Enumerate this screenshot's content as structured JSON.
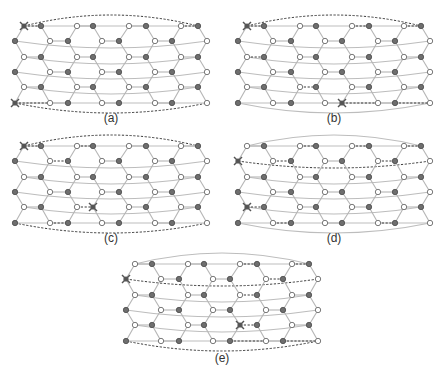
{
  "figure": {
    "legend": {
      "filled_node": "sublattice B",
      "hollow_node": "sublattice A",
      "x_marker": "defect / excitation",
      "dashed_line": "string operator path"
    },
    "lattice": {
      "rows": 6,
      "columns_per_row": 8,
      "row_types": [
        "even",
        "odd",
        "even",
        "odd",
        "even",
        "odd"
      ],
      "even_row_fill": [
        "H",
        "F",
        "H",
        "F",
        "H",
        "F",
        "H",
        "F"
      ],
      "odd_row_fill": [
        "F",
        "H",
        "F",
        "H",
        "F",
        "H",
        "F",
        "H"
      ]
    },
    "panels": [
      {
        "label": "(a)",
        "markers": [
          [
            0,
            0
          ],
          [
            5,
            0
          ]
        ],
        "dashed": {
          "top_arc": true,
          "bottom_arc": true,
          "wrap_rows": [],
          "segments": [
            [
              [
                0,
                0
              ],
              [
                0,
                1
              ]
            ],
            [
              [
                5,
                0
              ],
              [
                5,
                1
              ]
            ],
            [
              [
                0,
                6
              ],
              [
                0,
                7
              ]
            ]
          ]
        },
        "solid_arcs": {
          "top": false,
          "bottom": false
        }
      },
      {
        "label": "(b)",
        "markers": [
          [
            0,
            0
          ],
          [
            5,
            4
          ]
        ],
        "dashed": {
          "top_arc": true,
          "bottom_arc": false,
          "wrap_rows": [],
          "segments": [
            [
              [
                0,
                0
              ],
              [
                0,
                1
              ]
            ],
            [
              [
                0,
                4
              ],
              [
                0,
                5
              ]
            ],
            [
              [
                0,
                6
              ],
              [
                0,
                7
              ]
            ],
            [
              [
                2,
                0
              ],
              [
                2,
                1
              ]
            ],
            [
              [
                4,
                2
              ],
              [
                4,
                3
              ]
            ],
            [
              [
                5,
                4
              ],
              [
                5,
                5
              ]
            ],
            [
              [
                5,
                6
              ],
              [
                5,
                7
              ]
            ]
          ]
        },
        "solid_arcs": {
          "top": false,
          "bottom": true
        }
      },
      {
        "label": "(c)",
        "markers": [
          [
            0,
            0
          ],
          [
            4,
            3
          ]
        ],
        "dashed": {
          "top_arc": true,
          "bottom_arc": true,
          "wrap_rows": [],
          "segments": [
            [
              [
                0,
                0
              ],
              [
                0,
                1
              ]
            ],
            [
              [
                0,
                2
              ],
              [
                0,
                3
              ]
            ],
            [
              [
                1,
                1
              ],
              [
                1,
                2
              ]
            ],
            [
              [
                5,
                1
              ],
              [
                5,
                2
              ]
            ],
            [
              [
                4,
                2
              ],
              [
                4,
                3
              ]
            ]
          ]
        },
        "solid_arcs": {
          "top": false,
          "bottom": false
        }
      },
      {
        "label": "(d)",
        "markers": [
          [
            1,
            0
          ],
          [
            4,
            0
          ]
        ],
        "dashed": {
          "top_arc": false,
          "bottom_arc": false,
          "wrap_rows": [
            1
          ],
          "segments": [
            [
              [
                0,
                2
              ],
              [
                0,
                3
              ]
            ],
            [
              [
                0,
                4
              ],
              [
                0,
                5
              ]
            ],
            [
              [
                0,
                6
              ],
              [
                0,
                7
              ]
            ],
            [
              [
                1,
                1
              ],
              [
                1,
                2
              ]
            ],
            [
              [
                1,
                5
              ],
              [
                1,
                6
              ]
            ],
            [
              [
                4,
                0
              ],
              [
                4,
                1
              ]
            ],
            [
              [
                5,
                1
              ],
              [
                5,
                2
              ]
            ],
            [
              [
                5,
                5
              ],
              [
                5,
                6
              ]
            ]
          ]
        },
        "solid_arcs": {
          "top": true,
          "bottom": true
        }
      },
      {
        "label": "(e)",
        "markers": [
          [
            1,
            0
          ],
          [
            4,
            4
          ]
        ],
        "dashed": {
          "top_arc": false,
          "bottom_arc": true,
          "wrap_rows": [
            1
          ],
          "segments": [
            [
              [
                0,
                4
              ],
              [
                0,
                5
              ]
            ],
            [
              [
                0,
                6
              ],
              [
                0,
                7
              ]
            ],
            [
              [
                1,
                5
              ],
              [
                1,
                6
              ]
            ],
            [
              [
                2,
                4
              ],
              [
                2,
                5
              ]
            ],
            [
              [
                4,
                4
              ],
              [
                4,
                5
              ]
            ],
            [
              [
                5,
                4
              ],
              [
                5,
                5
              ]
            ],
            [
              [
                5,
                6
              ],
              [
                5,
                7
              ]
            ]
          ]
        },
        "solid_arcs": {
          "top": true,
          "bottom": false
        }
      }
    ]
  }
}
